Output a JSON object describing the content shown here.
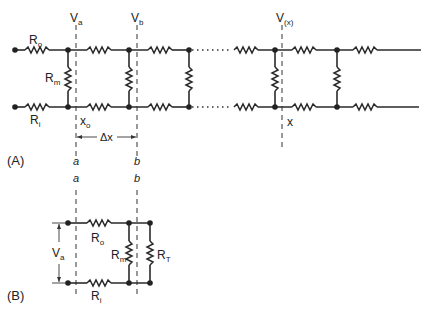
{
  "figure": {
    "part_a": {
      "panel_label": "(A)",
      "labels": {
        "ro": {
          "main": "R",
          "sub": "o"
        },
        "ri": {
          "main": "R",
          "sub": "i"
        },
        "rm": {
          "main": "R",
          "sub": "m"
        },
        "va": {
          "main": "V",
          "sub": "a"
        },
        "vb": {
          "main": "V",
          "sub": "b"
        },
        "vx": {
          "main": "V",
          "sub": "(x)"
        },
        "x0": {
          "main": "x",
          "sub": "o"
        },
        "x": "x",
        "dx": "Δx",
        "a": "a",
        "b": "b"
      }
    },
    "part_b": {
      "panel_label": "(B)",
      "labels": {
        "a": "a",
        "b": "b",
        "va": {
          "main": "V",
          "sub": "a"
        },
        "ro": {
          "main": "R",
          "sub": "o"
        },
        "ri": {
          "main": "R",
          "sub": "i"
        },
        "rm": {
          "main": "R",
          "sub": "m"
        },
        "rt": {
          "main": "R",
          "sub": "T"
        }
      }
    }
  }
}
